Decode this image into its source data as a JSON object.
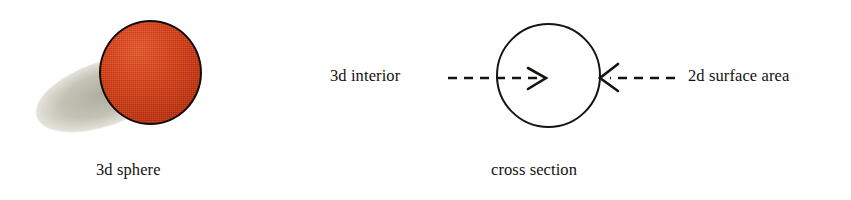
{
  "figure": {
    "background_color": "#ffffff",
    "text_color": "#141110"
  },
  "panels": {
    "left": {
      "caption": "3d sphere",
      "sphere": {
        "name": "3d-sphere",
        "fill_color": "#dd4419",
        "highlight_color": "#ef5c2a",
        "shade_color": "#ab2808",
        "outline_color": "#120d0b",
        "shadow_color": "#bab8a8"
      }
    },
    "right": {
      "caption": "cross section",
      "circle": {
        "name": "cross-section-circle",
        "fill_color": "#ffffff",
        "outline_color": "#17140f"
      },
      "annotations": [
        {
          "label": "3d interior",
          "arrow_direction": "right",
          "arrow_style": "dashed",
          "points_to": "interior"
        },
        {
          "label": "2d surface area",
          "arrow_direction": "left",
          "arrow_style": "dashed",
          "points_to": "boundary"
        }
      ]
    }
  }
}
